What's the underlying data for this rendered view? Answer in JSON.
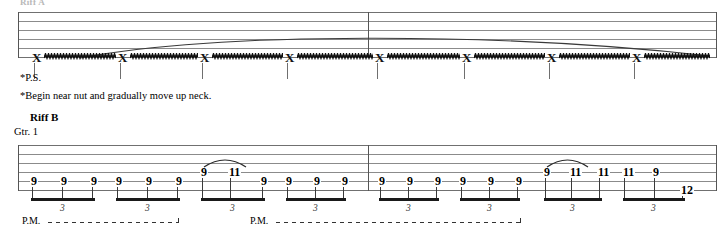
{
  "page": {
    "top_label": "Riff A",
    "width": 717,
    "height": 250
  },
  "upper_system": {
    "label": "",
    "staff_lines": 6,
    "technique": "pick scrape / P.S.",
    "notehead_glyph": "X",
    "note_count": 8,
    "note_x": [
      32,
      118,
      200,
      285,
      375,
      462,
      547,
      632
    ],
    "slur_present": true,
    "barline_x": 368,
    "footnote_ps": "*P.S.",
    "footnote_long": "*Begin near nut and gradually move up neck."
  },
  "lower_system": {
    "riff_label": "Riff B",
    "part_label": "Gtr. 1",
    "staff_lines": 6,
    "barline_x": 368,
    "triplet_marker": "3",
    "groups": [
      {
        "x": 30,
        "triplet": "3",
        "notes": [
          {
            "fret": "9",
            "string": 5,
            "x": 30
          },
          {
            "fret": "9",
            "string": 5,
            "x": 60
          },
          {
            "fret": "9",
            "string": 5,
            "x": 90
          }
        ],
        "slur": null
      },
      {
        "x": 115,
        "triplet": "3",
        "notes": [
          {
            "fret": "9",
            "string": 5,
            "x": 115
          },
          {
            "fret": "9",
            "string": 5,
            "x": 145
          },
          {
            "fret": "9",
            "string": 5,
            "x": 175
          }
        ],
        "slur": null
      },
      {
        "x": 200,
        "triplet": "3",
        "notes": [
          {
            "fret": "9",
            "string": 4,
            "x": 200
          },
          {
            "fret": "11",
            "string": 4,
            "x": 228
          },
          {
            "fret": "9",
            "string": 5,
            "x": 260
          }
        ],
        "slur": {
          "from": 200,
          "to": 232
        }
      },
      {
        "x": 285,
        "triplet": "3",
        "notes": [
          {
            "fret": "9",
            "string": 5,
            "x": 285
          },
          {
            "fret": "9",
            "string": 5,
            "x": 313
          },
          {
            "fret": "9",
            "string": 5,
            "x": 341
          }
        ],
        "slur": null
      },
      {
        "x": 378,
        "triplet": "3",
        "notes": [
          {
            "fret": "9",
            "string": 5,
            "x": 378
          },
          {
            "fret": "9",
            "string": 5,
            "x": 406
          },
          {
            "fret": "9",
            "string": 5,
            "x": 434
          }
        ],
        "slur": null
      },
      {
        "x": 459,
        "triplet": "3",
        "notes": [
          {
            "fret": "9",
            "string": 5,
            "x": 459
          },
          {
            "fret": "9",
            "string": 5,
            "x": 487
          },
          {
            "fret": "9",
            "string": 5,
            "x": 515
          }
        ],
        "slur": null
      },
      {
        "x": 543,
        "triplet": "3",
        "notes": [
          {
            "fret": "9",
            "string": 4,
            "x": 543
          },
          {
            "fret": "11",
            "string": 4,
            "x": 569
          },
          {
            "fret": "11",
            "string": 4,
            "x": 597
          }
        ],
        "slur": {
          "from": 543,
          "to": 574
        }
      },
      {
        "x": 622,
        "triplet": "3",
        "notes": [
          {
            "fret": "11",
            "string": 4,
            "x": 622
          },
          {
            "fret": "9",
            "string": 4,
            "x": 652
          },
          {
            "fret": "12",
            "string": 6,
            "x": 680
          }
        ],
        "slur": null
      }
    ],
    "palm_mutes": [
      {
        "label": "P.M.",
        "x": 22,
        "line_start": 48,
        "line_end": 178
      },
      {
        "label": "P.M.",
        "x": 250,
        "line_start": 276,
        "line_end": 520
      }
    ]
  }
}
